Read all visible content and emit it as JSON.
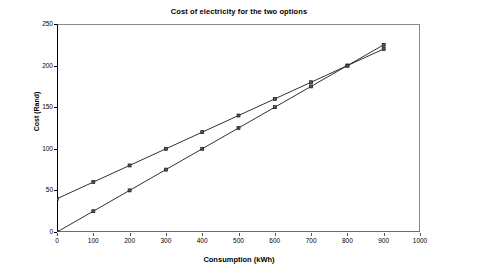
{
  "chart_data": {
    "type": "line",
    "title": "Cost of electricity for the two options",
    "xlabel": "Consumption (kWh)",
    "ylabel": "Cost (Rand)",
    "xlim": [
      0,
      1000
    ],
    "ylim": [
      0,
      250
    ],
    "xticks": [
      0,
      100,
      200,
      300,
      400,
      500,
      600,
      700,
      800,
      900,
      1000
    ],
    "yticks": [
      0,
      50,
      100,
      150,
      200,
      250
    ],
    "grid": false,
    "legend": null,
    "marker": "square",
    "line_color": "#1a1a1a",
    "x": [
      0,
      100,
      200,
      300,
      400,
      500,
      600,
      700,
      800,
      900
    ],
    "series": [
      {
        "name": "Option A",
        "values": [
          40,
          60,
          80,
          100,
          120,
          140,
          160,
          180,
          200,
          220
        ]
      },
      {
        "name": "Option B",
        "values": [
          0,
          25,
          50,
          75,
          100,
          125,
          150,
          175,
          200,
          225
        ]
      }
    ],
    "annotations": []
  }
}
